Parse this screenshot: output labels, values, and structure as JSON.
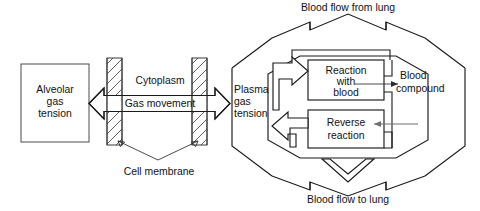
{
  "figure": {
    "title_visible": false,
    "background_color": "#ffffff",
    "line_color": "#1a1a1a",
    "text_color": "#111111",
    "grey_arrow_color": "#6f6f6f"
  },
  "labels": {
    "alveolar_line1": "Alveolar",
    "alveolar_line2": "gas",
    "alveolar_line3": "tension",
    "cytoplasm": "Cytoplasm",
    "gas_movement": "Gas movement",
    "cell_membrane": "Cell membrane",
    "plasma_line1": "Plasma",
    "plasma_line2": "gas",
    "plasma_line3": "tension",
    "reaction_line1": "Reaction",
    "reaction_line2": "with",
    "reaction_line3": "blood",
    "reverse_line1": "Reverse",
    "reverse_line2": "reaction",
    "blood_compound_line1": "Blood",
    "blood_compound_line2": "compound",
    "blood_flow_from_lung": "Blood flow from lung",
    "blood_flow_to_lung": "Blood flow to lung"
  },
  "icons": {
    "gas_movement_arrow": "double-headed-block-arrow",
    "membrane_left": "hatched-membrane-bar",
    "membrane_right": "hatched-membrane-bar",
    "forward_reaction_arrow": "block-arrow-right",
    "reverse_reaction_arrow": "block-arrow-left",
    "blood_inflow_arrow": "chevron-arrow-up",
    "blood_outflow_arrow": "chevron-arrow-down",
    "blood_compound_out_arrow": "thin-arrow-right",
    "blood_compound_in_arrow": "thin-arrow-left",
    "cell_membrane_pointer_left": "thin-arrow",
    "cell_membrane_pointer_right": "thin-arrow"
  }
}
